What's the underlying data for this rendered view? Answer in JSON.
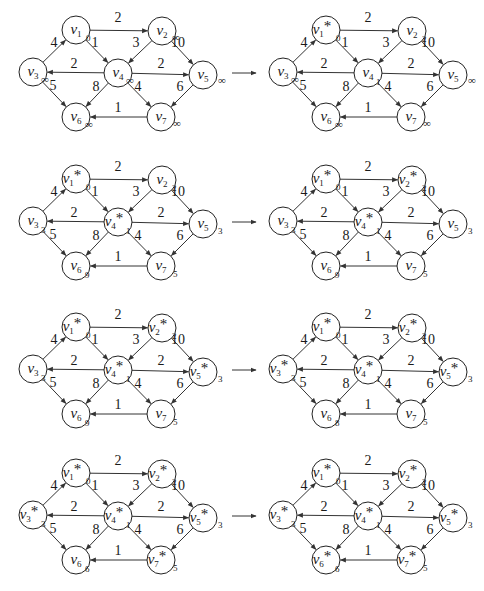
{
  "figure": {
    "arrow_symbol": "→",
    "infinity_symbol": "∞",
    "star_symbol": "*"
  },
  "graph": {
    "vertices": [
      {
        "id": "v1",
        "name": "v",
        "sub": "1",
        "x": 76,
        "y": 30
      },
      {
        "id": "v2",
        "name": "v",
        "sub": "2",
        "x": 162,
        "y": 31
      },
      {
        "id": "v3",
        "name": "v",
        "sub": "3",
        "x": 33,
        "y": 72
      },
      {
        "id": "v4",
        "name": "v",
        "sub": "4",
        "x": 118,
        "y": 73
      },
      {
        "id": "v5",
        "name": "v",
        "sub": "5",
        "x": 203,
        "y": 75
      },
      {
        "id": "v6",
        "name": "v",
        "sub": "6",
        "x": 76,
        "y": 117
      },
      {
        "id": "v7",
        "name": "v",
        "sub": "7",
        "x": 161,
        "y": 117
      }
    ],
    "edges": [
      {
        "from": "v3",
        "to": "v1",
        "w": "4",
        "lx": 54,
        "ly": 47
      },
      {
        "from": "v1",
        "to": "v2",
        "w": "2",
        "lx": 118,
        "ly": 22
      },
      {
        "from": "v1",
        "to": "v4",
        "w": "1",
        "lx": 95,
        "ly": 47
      },
      {
        "from": "v2",
        "to": "v4",
        "w": "3",
        "lx": 136,
        "ly": 47
      },
      {
        "from": "v2",
        "to": "v5",
        "w": "10",
        "lx": 178,
        "ly": 47
      },
      {
        "from": "v4",
        "to": "v3",
        "w": "2",
        "lx": 74,
        "ly": 68
      },
      {
        "from": "v4",
        "to": "v5",
        "w": "2",
        "lx": 161,
        "ly": 68
      },
      {
        "from": "v3",
        "to": "v6",
        "w": "5",
        "lx": 53,
        "ly": 90
      },
      {
        "from": "v4",
        "to": "v6",
        "w": "8",
        "lx": 96,
        "ly": 91
      },
      {
        "from": "v4",
        "to": "v7",
        "w": "4",
        "lx": 138,
        "ly": 91
      },
      {
        "from": "v5",
        "to": "v7",
        "w": "6",
        "lx": 180,
        "ly": 91
      },
      {
        "from": "v7",
        "to": "v6",
        "w": "1",
        "lx": 118,
        "ly": 112
      }
    ]
  },
  "panels": [
    {
      "id": "p1",
      "dx": 0,
      "dy": 0,
      "labels": {
        "v1": "0",
        "v2": "∞",
        "v3": "∞",
        "v4": "∞",
        "v5": "∞",
        "v6": "∞",
        "v7": "∞"
      },
      "starred": []
    },
    {
      "id": "p2",
      "dx": 250,
      "dy": 0,
      "labels": {
        "v1": "0",
        "v2": "2",
        "v3": "∞",
        "v4": "1",
        "v5": "∞",
        "v6": "∞",
        "v7": "∞"
      },
      "starred": [
        "v1"
      ]
    },
    {
      "id": "p3",
      "dx": 0,
      "dy": 149,
      "labels": {
        "v1": "0",
        "v2": "2",
        "v3": "3",
        "v4": "1",
        "v5": "3",
        "v6": "9",
        "v7": "5"
      },
      "starred": [
        "v1",
        "v4"
      ]
    },
    {
      "id": "p4",
      "dx": 250,
      "dy": 149,
      "labels": {
        "v1": "0",
        "v2": "2",
        "v3": "3",
        "v4": "1",
        "v5": "3",
        "v6": "9",
        "v7": "5"
      },
      "starred": [
        "v1",
        "v2",
        "v4"
      ]
    },
    {
      "id": "p5",
      "dx": 0,
      "dy": 297,
      "labels": {
        "v1": "0",
        "v2": "2",
        "v3": "3",
        "v4": "1",
        "v5": "3",
        "v6": "9",
        "v7": "5"
      },
      "starred": [
        "v1",
        "v2",
        "v4",
        "v5"
      ]
    },
    {
      "id": "p6",
      "dx": 250,
      "dy": 297,
      "labels": {
        "v1": "0",
        "v2": "2",
        "v3": "3",
        "v4": "1",
        "v5": "3",
        "v6": "8",
        "v7": "5"
      },
      "starred": [
        "v1",
        "v2",
        "v3",
        "v4",
        "v5"
      ]
    },
    {
      "id": "p7",
      "dx": 0,
      "dy": 443,
      "labels": {
        "v1": "0",
        "v2": "2",
        "v3": "3",
        "v4": "1",
        "v5": "3",
        "v6": "6",
        "v7": "5"
      },
      "starred": [
        "v1",
        "v2",
        "v3",
        "v4",
        "v5",
        "v7"
      ]
    },
    {
      "id": "p8",
      "dx": 250,
      "dy": 443,
      "labels": {
        "v1": "0",
        "v2": "2",
        "v3": "3",
        "v4": "1",
        "v5": "3",
        "v6": "6",
        "v7": "5"
      },
      "starred": [
        "v1",
        "v2",
        "v3",
        "v4",
        "v5",
        "v6",
        "v7"
      ]
    }
  ],
  "row_arrows": [
    {
      "x1": 232,
      "x2": 256,
      "y": 73
    },
    {
      "x1": 232,
      "x2": 256,
      "y": 222
    },
    {
      "x1": 232,
      "x2": 256,
      "y": 370
    },
    {
      "x1": 232,
      "x2": 256,
      "y": 516
    }
  ],
  "label_offsets": {
    "v1": [
      10,
      11
    ],
    "v2": [
      10,
      11
    ],
    "v3": [
      8,
      12
    ],
    "v4": [
      8,
      12
    ],
    "v5": [
      15,
      10
    ],
    "v6": [
      9,
      12
    ],
    "v7": [
      12,
      11
    ]
  }
}
